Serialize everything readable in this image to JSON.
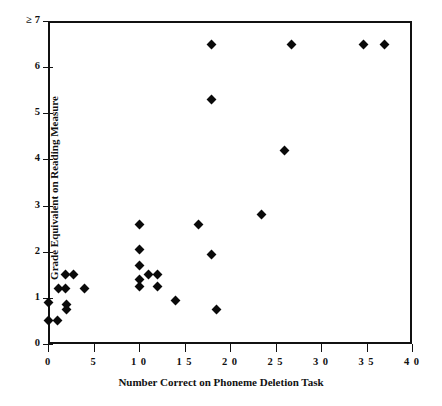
{
  "chart_data": {
    "type": "scatter",
    "title": "",
    "xlabel": "Number Correct on Phoneme Deletion Task",
    "ylabel": "Grade Equivalent on Reading Measure",
    "xlim": [
      0,
      40
    ],
    "ylim": [
      0,
      7
    ],
    "xticks": [
      0,
      5,
      10,
      15,
      20,
      25,
      30,
      35,
      40
    ],
    "xticklabels": [
      "0",
      "5",
      "1 0",
      "1 5",
      "2 0",
      "2 5",
      "3 0",
      "3 5",
      "4 0"
    ],
    "yticks": [
      0,
      1,
      2,
      3,
      4,
      5,
      6,
      7
    ],
    "yticklabels": [
      "0",
      "1",
      "2",
      "3",
      "4",
      "5",
      "6",
      "≥ 7"
    ],
    "grid": false,
    "legend": null,
    "marker": "diamond",
    "marker_color": "#0a0a0a",
    "points": [
      {
        "x": 0.0,
        "y": 0.5
      },
      {
        "x": 0.0,
        "y": 0.9
      },
      {
        "x": 1.0,
        "y": 0.5
      },
      {
        "x": 1.1,
        "y": 1.2
      },
      {
        "x": 1.9,
        "y": 1.2
      },
      {
        "x": 2.0,
        "y": 0.75
      },
      {
        "x": 2.0,
        "y": 0.85
      },
      {
        "x": 1.9,
        "y": 1.5
      },
      {
        "x": 2.8,
        "y": 1.5
      },
      {
        "x": 4.0,
        "y": 1.2
      },
      {
        "x": 10.0,
        "y": 1.25
      },
      {
        "x": 10.0,
        "y": 1.4
      },
      {
        "x": 10.0,
        "y": 1.7
      },
      {
        "x": 10.0,
        "y": 2.05
      },
      {
        "x": 10.0,
        "y": 2.6
      },
      {
        "x": 11.0,
        "y": 1.5
      },
      {
        "x": 12.0,
        "y": 1.25
      },
      {
        "x": 12.0,
        "y": 1.5
      },
      {
        "x": 14.0,
        "y": 0.95
      },
      {
        "x": 16.5,
        "y": 2.6
      },
      {
        "x": 18.5,
        "y": 0.75
      },
      {
        "x": 18.0,
        "y": 1.95
      },
      {
        "x": 18.0,
        "y": 5.3
      },
      {
        "x": 18.0,
        "y": 6.5
      },
      {
        "x": 23.5,
        "y": 2.8
      },
      {
        "x": 26.0,
        "y": 4.2
      },
      {
        "x": 26.8,
        "y": 6.5
      },
      {
        "x": 34.7,
        "y": 6.5
      },
      {
        "x": 37.0,
        "y": 6.5
      }
    ]
  },
  "figure": {
    "background": "#ffffff",
    "axis_color": "#111111",
    "caption": ""
  }
}
